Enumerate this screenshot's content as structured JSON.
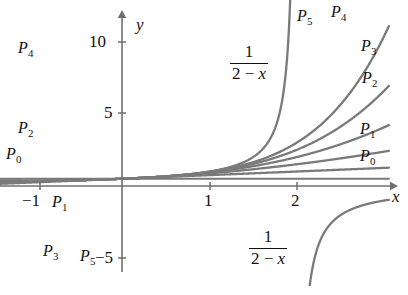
{
  "figure": {
    "line_color": "#7a7a7a",
    "axis_color": "#6f6f6f",
    "text_color": "#111111",
    "background": "#ffffff"
  },
  "axes": {
    "x_label": "x",
    "y_label": "y",
    "x_ticks": [
      {
        "value": -1,
        "label": "−1",
        "px": 40
      },
      {
        "value": 1,
        "label": "1",
        "px": 210
      },
      {
        "value": 2,
        "label": "2",
        "px": 297
      }
    ],
    "y_ticks": [
      {
        "value": 10,
        "label": "10",
        "px": 42
      },
      {
        "value": 5,
        "label": "5",
        "px": 113
      },
      {
        "value": -5,
        "label": "−5",
        "px": 258
      }
    ],
    "origin_px": {
      "x": 122,
      "y": 186
    },
    "unit_px": {
      "x": 87.5,
      "y": 14.5
    },
    "xlim": [
      -1.4,
      3.05
    ],
    "ylim": [
      -7.5,
      11.6
    ]
  },
  "formula": {
    "numerator": "1",
    "denominator_left": "2 − ",
    "denominator_var": "x",
    "full": "1/(2 − x)"
  },
  "annotations": {
    "formula_upper": {
      "text": "1/(2 - x)",
      "x": 230,
      "y": 43
    },
    "formula_lower": {
      "text": "1/(2 - x)",
      "x": 249,
      "y": 228
    }
  },
  "curve_labels": [
    {
      "name": "P4",
      "base": "P",
      "sub": "4",
      "x": 18,
      "y": 40,
      "side": "left"
    },
    {
      "name": "P2",
      "base": "P",
      "sub": "2",
      "x": 18,
      "y": 120,
      "side": "left"
    },
    {
      "name": "P0",
      "base": "P",
      "sub": "0",
      "x": 6,
      "y": 146,
      "side": "left"
    },
    {
      "name": "P1",
      "base": "P",
      "sub": "1",
      "x": 52,
      "y": 194,
      "side": "left"
    },
    {
      "name": "P3",
      "base": "P",
      "sub": "3",
      "x": 43,
      "y": 243,
      "side": "left"
    },
    {
      "name": "P5",
      "base": "P",
      "sub": "5",
      "x": 80,
      "y": 248,
      "side": "left"
    },
    {
      "name": "P5",
      "base": "P",
      "sub": "5",
      "x": 297,
      "y": 8,
      "side": "right"
    },
    {
      "name": "P4",
      "base": "P",
      "sub": "4",
      "x": 331,
      "y": 4,
      "side": "right"
    },
    {
      "name": "P3",
      "base": "P",
      "sub": "3",
      "x": 361,
      "y": 38,
      "side": "right"
    },
    {
      "name": "P2",
      "base": "P",
      "sub": "2",
      "x": 362,
      "y": 70,
      "side": "right"
    },
    {
      "name": "P1",
      "base": "P",
      "sub": "1",
      "x": 360,
      "y": 121,
      "side": "right"
    },
    {
      "name": "P0",
      "base": "P",
      "sub": "0",
      "x": 360,
      "y": 148,
      "side": "right"
    }
  ],
  "chart_data": {
    "type": "line",
    "xlabel": "x",
    "ylabel": "y",
    "xlim": [
      -1.4,
      3.05
    ],
    "ylim": [
      -7.5,
      11.6
    ],
    "xticks": [
      -1,
      1,
      2
    ],
    "yticks": [
      -5,
      5,
      10
    ],
    "grid": false,
    "legend": "inline-labels",
    "series": [
      {
        "name": "P0",
        "expr": "0.5",
        "degree": 0,
        "label_positions": [
          "left",
          "right"
        ],
        "x": [
          -1.4,
          -1.0,
          -0.5,
          0.0,
          0.5,
          1.0,
          1.5,
          2.0,
          2.5,
          3.0
        ],
        "y": [
          0.5,
          0.5,
          0.5,
          0.5,
          0.5,
          0.5,
          0.5,
          0.5,
          0.5,
          0.5
        ]
      },
      {
        "name": "P1",
        "expr": "0.5 + 0.25x",
        "degree": 1,
        "x": [
          -1.4,
          -1.0,
          -0.5,
          0.0,
          0.5,
          1.0,
          1.5,
          2.0,
          2.5,
          3.0
        ],
        "y": [
          0.15,
          0.25,
          0.375,
          0.5,
          0.625,
          0.75,
          0.875,
          1.0,
          1.125,
          1.25
        ]
      },
      {
        "name": "P2",
        "expr": "0.5 + 0.25x + 0.125x^2",
        "degree": 2,
        "x": [
          -1.4,
          -1.0,
          -0.5,
          0.0,
          0.5,
          1.0,
          1.5,
          2.0,
          2.5,
          3.0
        ],
        "y": [
          0.395,
          0.375,
          0.406,
          0.5,
          0.656,
          0.875,
          1.156,
          1.5,
          1.906,
          2.375
        ]
      },
      {
        "name": "P3",
        "expr": "0.5 + 0.25x + 0.125x^2 + 0.0625x^3",
        "degree": 3,
        "x": [
          -1.4,
          -1.0,
          -0.5,
          0.0,
          0.5,
          1.0,
          1.5,
          2.0,
          2.5,
          3.0
        ],
        "y": [
          0.224,
          0.313,
          0.398,
          0.5,
          0.664,
          0.938,
          1.367,
          2.0,
          2.883,
          4.063
        ]
      },
      {
        "name": "P4",
        "expr": "sum_{k=0}^{4} x^k / 2^{k+1}",
        "degree": 4,
        "x": [
          -1.4,
          -1.0,
          -0.5,
          0.0,
          0.5,
          1.0,
          1.5,
          2.0,
          2.5,
          3.0
        ],
        "y": [
          2.624,
          0.375,
          0.4,
          0.5,
          0.666,
          0.969,
          1.525,
          2.5,
          4.824,
          6.594
        ]
      },
      {
        "name": "P5",
        "expr": "sum_{k=0}^{5} x^k / 2^{k+1}",
        "degree": 5,
        "x": [
          -1.4,
          -1.0,
          -0.5,
          0.0,
          0.5,
          1.0,
          1.5,
          2.0,
          2.5,
          3.0
        ],
        "y": [
          -1.056,
          0.344,
          0.398,
          0.5,
          0.667,
          0.984,
          1.643,
          3.0,
          5.266,
          10.0
        ]
      },
      {
        "name": "f",
        "expr": "1/(2 - x)",
        "branch": "left",
        "x": [
          -1.4,
          -1.0,
          -0.5,
          0.0,
          0.5,
          1.0,
          1.5,
          1.8
        ],
        "y": [
          0.294,
          0.333,
          0.4,
          0.5,
          0.667,
          1.0,
          2.0,
          5.0
        ]
      },
      {
        "name": "f",
        "expr": "1/(2 - x)",
        "branch": "right",
        "x": [
          2.15,
          2.3,
          2.5,
          2.8,
          3.05
        ],
        "y": [
          -6.67,
          -3.33,
          -2.0,
          -1.25,
          -0.95
        ]
      }
    ],
    "asymptote": {
      "type": "vertical",
      "x": 2
    }
  }
}
